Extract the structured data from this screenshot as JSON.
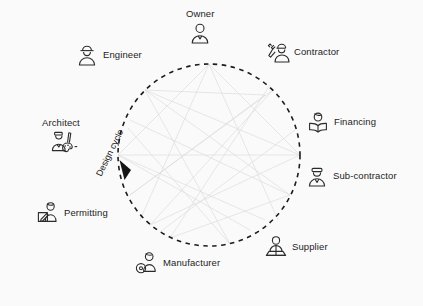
{
  "diagram": {
    "title": "Design cycle",
    "cycle_label": "Design cycle",
    "direction": "counter-clockwise",
    "background_color": "#fafafa",
    "line_color": "#1c1c1c",
    "web_color": "#d8d8d8",
    "circle": {
      "cx": 209,
      "cy": 155,
      "r": 91,
      "style": "dashed"
    },
    "nodes": [
      {
        "id": "owner",
        "label": "Owner",
        "icon": "person-bust-icon",
        "layout": "stack",
        "x": 186,
        "y": 9
      },
      {
        "id": "engineer",
        "label": "Engineer",
        "icon": "person-hardhat-icon",
        "layout": "icon-right",
        "x": 74,
        "y": 42
      },
      {
        "id": "contractor",
        "label": "Contractor",
        "icon": "person-wrench-icon",
        "layout": "icon-left",
        "x": 265,
        "y": 39
      },
      {
        "id": "financing",
        "label": "Financing",
        "icon": "person-book-icon",
        "layout": "icon-left",
        "x": 305,
        "y": 109
      },
      {
        "id": "sub-contractor",
        "label": "Sub-contractor",
        "icon": "person-cap-icon",
        "layout": "icon-left",
        "x": 304,
        "y": 163
      },
      {
        "id": "supplier",
        "label": "Supplier",
        "icon": "person-counter-icon",
        "layout": "icon-left",
        "x": 263,
        "y": 234
      },
      {
        "id": "manufacturer",
        "label": "Manufacturer",
        "icon": "person-gear-icon",
        "layout": "icon-left",
        "x": 134,
        "y": 250
      },
      {
        "id": "permitting",
        "label": "Permitting",
        "icon": "person-document-icon",
        "layout": "icon-right",
        "x": 35,
        "y": 200
      },
      {
        "id": "architect",
        "label": "Architect",
        "icon": "person-palette-icon",
        "layout": "stack",
        "x": 42,
        "y": 118
      }
    ]
  }
}
